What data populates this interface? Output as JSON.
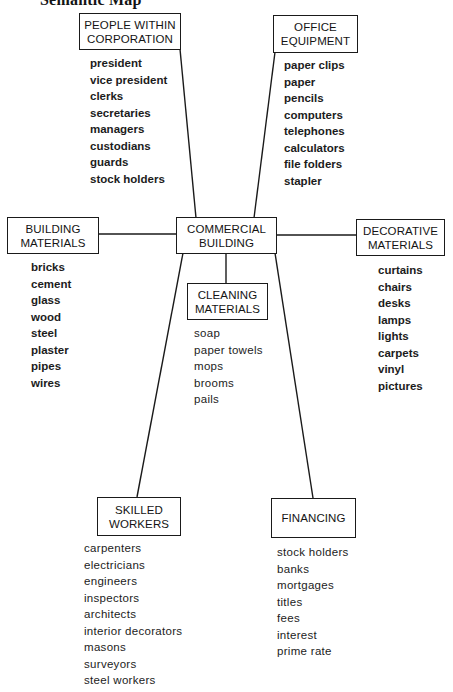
{
  "title": {
    "number": "",
    "text": "Semantic Map"
  },
  "center": {
    "label": "COMMERCIAL\nBUILDING"
  },
  "categories": {
    "people": {
      "label": "PEOPLE WITHIN\nCORPORATION",
      "items": [
        "president",
        "vice president",
        "clerks",
        "secretaries",
        "managers",
        "custodians",
        "guards",
        "stock holders"
      ]
    },
    "office": {
      "label": "OFFICE\nEQUIPMENT",
      "items": [
        "paper clips",
        "paper",
        "pencils",
        "computers",
        "telephones",
        "calculators",
        "file folders",
        "stapler"
      ]
    },
    "building": {
      "label": "BUILDING\nMATERIALS",
      "items": [
        "bricks",
        "cement",
        "glass",
        "wood",
        "steel",
        "plaster",
        "pipes",
        "wires"
      ]
    },
    "decorative": {
      "label": "DECORATIVE\nMATERIALS",
      "items": [
        "curtains",
        "chairs",
        "desks",
        "lamps",
        "lights",
        "carpets",
        "vinyl",
        "pictures"
      ]
    },
    "cleaning": {
      "label": "CLEANING\nMATERIALS",
      "items": [
        "soap",
        "paper towels",
        "mops",
        "brooms",
        "pails"
      ]
    },
    "skilled": {
      "label": "SKILLED\nWORKERS",
      "items": [
        "carpenters",
        "electricians",
        "engineers",
        "inspectors",
        "architects",
        "interior decorators",
        "masons",
        "surveyors",
        "steel workers"
      ]
    },
    "financing": {
      "label": "FINANCING",
      "items": [
        "stock holders",
        "banks",
        "mortgages",
        "titles",
        "fees",
        "interest",
        "prime rate"
      ]
    }
  },
  "colors": {
    "ink": "#1a1a1a",
    "paper": "#ffffff"
  }
}
